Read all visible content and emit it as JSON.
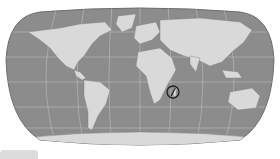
{
  "map": {
    "title": "World map",
    "projection": "Robinson-like",
    "style": "grayscale",
    "colors": {
      "ocean": "#8c8c8c",
      "land": "#d9d9d9",
      "graticule": "#bdbdbd",
      "outline": "#6e6e6e",
      "marker": "#222222"
    },
    "marker": {
      "label": "Compass marker",
      "location": "near Madagascar"
    }
  },
  "bottom_tab": {
    "label": ""
  }
}
